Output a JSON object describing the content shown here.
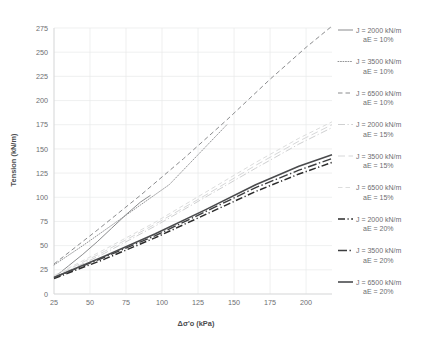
{
  "chart_data": {
    "type": "line",
    "title": "",
    "xlabel": "Δσ'o (kPa)",
    "ylabel": "Tension (kN/m)",
    "xlim": [
      25,
      218
    ],
    "ylim": [
      0,
      275
    ],
    "xticks": [
      25,
      50,
      75,
      100,
      125,
      150,
      175,
      200
    ],
    "yticks": [
      0,
      25,
      50,
      75,
      100,
      125,
      150,
      175,
      200,
      225,
      250,
      275
    ],
    "grid": true,
    "legend_position": "right",
    "series": [
      {
        "name": "J = 2000 kN/m aE = 10%",
        "stiffness": "J = 2000 kN/m",
        "strain": "aE = 10%",
        "style": "solid",
        "color": "#8a8b8d",
        "width": 1.0,
        "x": [
          25,
          35,
          45,
          55,
          65,
          75,
          85,
          92
        ],
        "y": [
          17,
          29,
          41,
          54,
          68,
          82,
          95,
          102
        ]
      },
      {
        "name": "J = 3500 kN/m aE = 10%",
        "stiffness": "J = 3500 kN/m",
        "strain": "aE = 10%",
        "style": "dotted",
        "color": "#939496",
        "width": 1.0,
        "x": [
          25,
          45,
          65,
          85,
          105,
          125,
          145
        ],
        "y": [
          30,
          50,
          71,
          92,
          113,
          144,
          175
        ]
      },
      {
        "name": "J = 6500 kN/m aE = 10%",
        "stiffness": "J = 6500 kN/m",
        "strain": "aE = 10%",
        "style": "dashed",
        "color": "#8a8b8d",
        "width": 1.0,
        "x": [
          25,
          55,
          85,
          115,
          145,
          175,
          200,
          218
        ],
        "y": [
          31,
          66,
          102,
          140,
          180,
          222,
          255,
          277
        ]
      },
      {
        "name": "J = 2000 kN/m aE = 15%",
        "stiffness": "J = 2000 kN/m",
        "strain": "aE = 15%",
        "style": "dash-dot",
        "color": "#cfd0d1",
        "width": 1.0,
        "x": [
          25,
          60,
          95,
          130,
          165,
          195,
          218
        ],
        "y": [
          17,
          42,
          70,
          100,
          130,
          155,
          172
        ]
      },
      {
        "name": "J = 3500 kN/m aE = 15%",
        "stiffness": "J = 3500 kN/m",
        "strain": "aE = 15%",
        "style": "long-dash",
        "color": "#d6d7d8",
        "width": 1.0,
        "x": [
          25,
          60,
          95,
          130,
          165,
          195,
          218
        ],
        "y": [
          18,
          44,
          72,
          102,
          133,
          158,
          175
        ]
      },
      {
        "name": "J = 6500 kN/m aE = 15%",
        "stiffness": "J = 6500 kN/m",
        "strain": "aE = 15%",
        "style": "dashed",
        "color": "#dcdddd",
        "width": 1.0,
        "x": [
          25,
          60,
          95,
          130,
          165,
          195,
          218
        ],
        "y": [
          19,
          46,
          74,
          105,
          136,
          161,
          178
        ]
      },
      {
        "name": "J = 2000 kN/m aE = 20%",
        "stiffness": "J = 2000 kN/m",
        "strain": "aE = 20%",
        "style": "dash-dot",
        "color": "#2b2b2b",
        "width": 1.5,
        "x": [
          25,
          60,
          95,
          130,
          165,
          195,
          218
        ],
        "y": [
          16,
          36,
          58,
          82,
          106,
          124,
          136
        ]
      },
      {
        "name": "J = 3500 kN/m aE = 20%",
        "stiffness": "J = 3500 kN/m",
        "strain": "aE = 20%",
        "style": "dash-dot-long",
        "color": "#3c3d3f",
        "width": 1.4,
        "x": [
          25,
          60,
          95,
          130,
          165,
          195,
          218
        ],
        "y": [
          17,
          38,
          60,
          85,
          110,
          128,
          140
        ]
      },
      {
        "name": "J = 6500 kN/m aE = 20%",
        "stiffness": "J = 6500 kN/m",
        "strain": "aE = 20%",
        "style": "solid",
        "color": "#4a4b4d",
        "width": 1.6,
        "x": [
          25,
          60,
          95,
          130,
          165,
          195,
          218
        ],
        "y": [
          17,
          39,
          62,
          87,
          113,
          132,
          144
        ]
      }
    ]
  },
  "axes": {
    "y_title": "Tension (kN/m)",
    "x_title": "Δσ'o (kPa)",
    "y_tick_labels": [
      "0",
      "25",
      "50",
      "75",
      "100",
      "125",
      "150",
      "175",
      "200",
      "225",
      "250",
      "275"
    ],
    "x_tick_labels": [
      "25",
      "50",
      "75",
      "100",
      "125",
      "150",
      "175",
      "200"
    ]
  },
  "legend": {
    "items": [
      {
        "line1": "J = 2000 kN/m",
        "line2": "aE = 10%",
        "swatch": "solid-gray"
      },
      {
        "line1": "J = 3500 kN/m",
        "line2": "aE = 10%",
        "swatch": "dotted-gray"
      },
      {
        "line1": "J = 6500 kN/m",
        "line2": "aE = 10%",
        "swatch": "dashed-gray"
      },
      {
        "line1": "J = 2000 kN/m",
        "line2": "aE = 15%",
        "swatch": "dash-dot-lightgray"
      },
      {
        "line1": "J = 3500 kN/m",
        "line2": "aE = 15%",
        "swatch": "long-dash-lightgray"
      },
      {
        "line1": "J = 6500 kN/m",
        "line2": "aE = 15%",
        "swatch": "dashed-lightgray"
      },
      {
        "line1": "J = 2000 kN/m",
        "line2": "aE = 20%",
        "swatch": "dash-dot-black"
      },
      {
        "line1": "J = 3500 kN/m",
        "line2": "aE = 20%",
        "swatch": "dash-dot-long-black"
      },
      {
        "line1": "J = 6500 kN/m",
        "line2": "aE = 20%",
        "swatch": "solid-black"
      }
    ]
  },
  "colors": {
    "grid": "#e8e9ea",
    "text": "#6d6e71",
    "background": "#ffffff"
  }
}
